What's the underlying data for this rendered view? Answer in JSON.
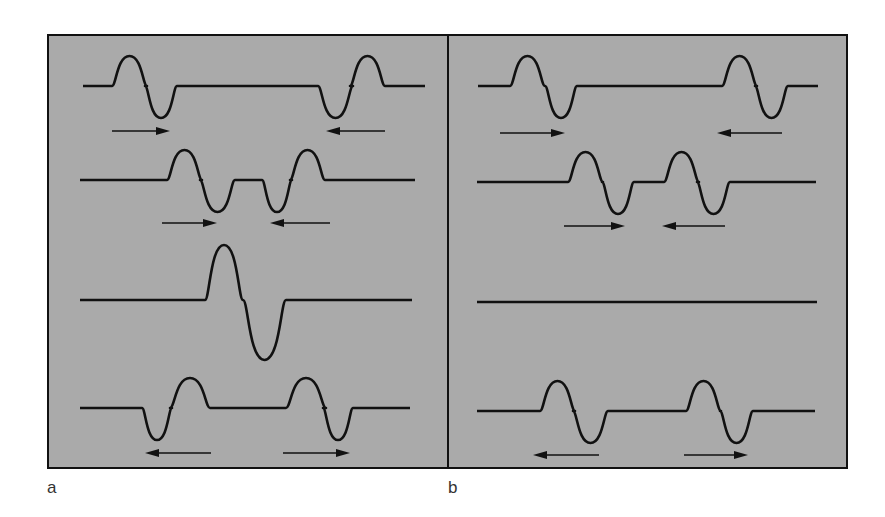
{
  "figure": {
    "background_color": "#aaaaaa",
    "line_color": "#111111",
    "panels": [
      {
        "id": "a",
        "label": "a",
        "rows": [
          {
            "description": "Two pulses approaching each other",
            "pulses": [
              {
                "position": "left",
                "shape": "up-then-down",
                "direction": "right"
              },
              {
                "position": "right",
                "shape": "down-then-up",
                "direction": "left"
              }
            ]
          },
          {
            "description": "Pulses closer together",
            "pulses": [
              {
                "position": "left",
                "shape": "up-then-down",
                "direction": "right"
              },
              {
                "position": "right",
                "shape": "down-then-up",
                "direction": "left"
              }
            ]
          },
          {
            "description": "Pulses overlapping — constructive superposition",
            "pulses": [
              {
                "position": "center",
                "shape": "up-then-down-large",
                "direction": "none"
              }
            ]
          },
          {
            "description": "Pulses moving apart after passing",
            "pulses": [
              {
                "position": "left",
                "shape": "down-then-up",
                "direction": "left"
              },
              {
                "position": "right",
                "shape": "up-then-down",
                "direction": "right"
              }
            ]
          }
        ]
      },
      {
        "id": "b",
        "label": "b",
        "rows": [
          {
            "description": "Two identical pulses approaching each other",
            "pulses": [
              {
                "position": "left",
                "shape": "up-then-down",
                "direction": "right"
              },
              {
                "position": "right",
                "shape": "up-then-down",
                "direction": "left"
              }
            ]
          },
          {
            "description": "Pulses closer together",
            "pulses": [
              {
                "position": "left",
                "shape": "up-then-down",
                "direction": "right"
              },
              {
                "position": "right",
                "shape": "up-then-down",
                "direction": "left"
              }
            ]
          },
          {
            "description": "Pulses overlapping — destructive superposition, flat line",
            "pulses": []
          },
          {
            "description": "Pulses moving apart after passing",
            "pulses": [
              {
                "position": "left",
                "shape": "up-then-down",
                "direction": "left"
              },
              {
                "position": "right",
                "shape": "up-then-down",
                "direction": "right"
              }
            ]
          }
        ]
      }
    ]
  }
}
